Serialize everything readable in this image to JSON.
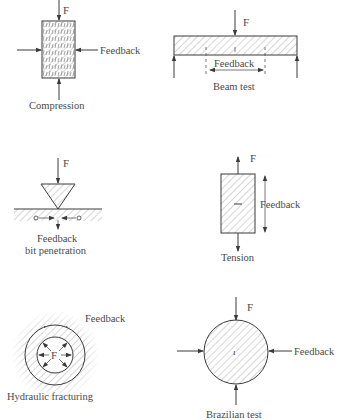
{
  "diagram": {
    "colors": {
      "line": "#3a3a3a",
      "hatch": "#9a9a9a",
      "text": "#4a4a4a",
      "background": "#ffffff"
    },
    "panels": [
      {
        "id": "compression",
        "caption": "Compression",
        "force_label": "F",
        "feedback_label": "Feedback"
      },
      {
        "id": "beam",
        "caption": "Beam test",
        "force_label": "F",
        "feedback_label": "Feedback"
      },
      {
        "id": "indentation",
        "caption": "bit penetration",
        "force_label": "F",
        "feedback_label": "Feedback"
      },
      {
        "id": "tension",
        "caption": "Tension",
        "force_label": "F",
        "feedback_label": "Feedback"
      },
      {
        "id": "hydraulic",
        "caption": "Hydraulic fracturing",
        "force_label": "F",
        "feedback_label": "Feedback"
      },
      {
        "id": "brazilian",
        "caption": "Brazilian test",
        "force_label": "F",
        "feedback_label": "Feedback"
      }
    ]
  }
}
